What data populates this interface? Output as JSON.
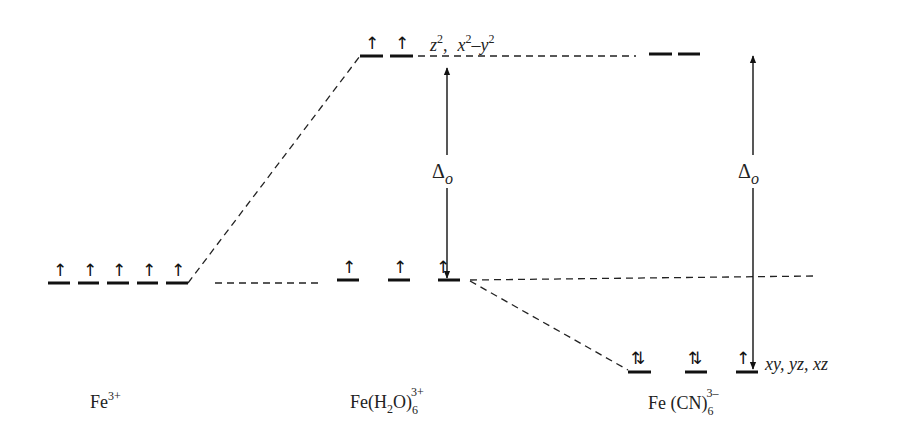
{
  "diagram": {
    "columns": [
      {
        "id": "free_ion",
        "label_main": "Fe",
        "label_sup": "3+",
        "levels": [
          {
            "spin": "↑"
          },
          {
            "spin": "↑"
          },
          {
            "spin": "↑"
          },
          {
            "spin": "↑"
          },
          {
            "spin": "↑"
          }
        ]
      },
      {
        "id": "hexaaqua",
        "label_main": "Fe(H",
        "label_sub2": "2",
        "label_mid": "O)",
        "label_sub6": "6",
        "label_sup": "3+",
        "eg_levels": [
          {
            "spin": "↑"
          },
          {
            "spin": "↑"
          }
        ],
        "t2g_levels": [
          {
            "spin": "↑"
          },
          {
            "spin": "↑"
          },
          {
            "spin": "↑"
          }
        ],
        "delta_label": "Δ",
        "delta_sub": "o"
      },
      {
        "id": "hexacyano",
        "label_main": "Fe (CN)",
        "label_sub6": "6",
        "label_sup": "3–",
        "eg_levels": [
          {
            "spin": ""
          },
          {
            "spin": ""
          }
        ],
        "t2g_levels": [
          {
            "spin": "⇅"
          },
          {
            "spin": "⇅"
          },
          {
            "spin": "↑"
          }
        ],
        "delta_label": "Δ",
        "delta_sub": "o"
      }
    ],
    "eg_label": {
      "z": "z",
      "z_sup": "2",
      "sep": ",",
      "x": "x",
      "x_sup": "2",
      "minus": "–",
      "y": "y",
      "y_sup": "2"
    },
    "t2g_label": "xy, yz, xz"
  }
}
